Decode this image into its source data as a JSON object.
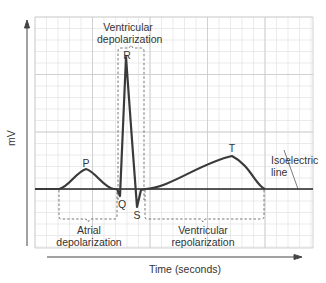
{
  "diagram": {
    "y_axis_label": "mV",
    "x_axis_label": "Time (seconds)",
    "waves": [
      {
        "id": "P",
        "label": "P"
      },
      {
        "id": "Q",
        "label": "Q"
      },
      {
        "id": "R",
        "label": "R"
      },
      {
        "id": "S",
        "label": "S"
      },
      {
        "id": "T",
        "label": "T"
      }
    ],
    "segments": {
      "ventricular_depolarization": [
        "Ventricular",
        "depolarization"
      ],
      "atrial_depolarization": [
        "Atrial",
        "depolarization"
      ],
      "ventricular_repolarization": [
        "Ventricular",
        "repolarization"
      ]
    },
    "isoelectric_line": [
      "Isoelectric",
      "line"
    ],
    "colors": {
      "trace": "#3a3a3a",
      "grid_minor": "#e2e2e2",
      "grid_major": "#c9c9c9",
      "text": "#333333"
    }
  }
}
